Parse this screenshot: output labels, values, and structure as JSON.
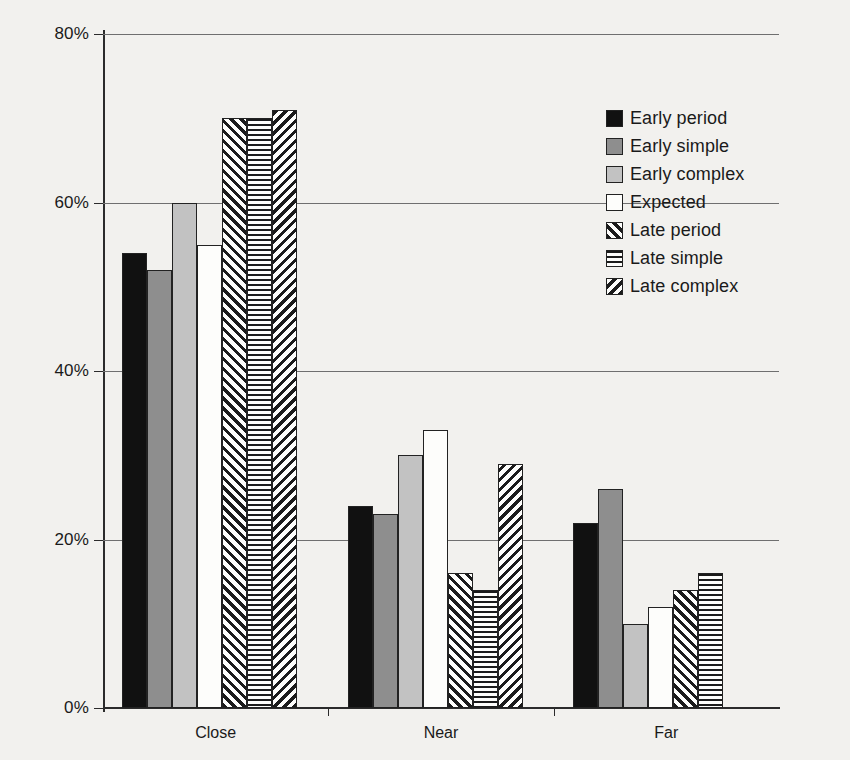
{
  "chart_data": {
    "type": "bar",
    "title": "",
    "subtitle": "",
    "xlabel": "",
    "ylabel": "",
    "categories": [
      "Close",
      "Near",
      "Far"
    ],
    "ylim": [
      0,
      80
    ],
    "ytick_labels": [
      "0%",
      "20%",
      "40%",
      "60%",
      "80%"
    ],
    "ytick_values": [
      0,
      20,
      40,
      60,
      80
    ],
    "grid": "horizontal",
    "legend_position": "inside-top-right",
    "value_suffix": "%",
    "series": [
      {
        "name": "Early period",
        "pattern": "solid-black",
        "color": "#111111",
        "values": [
          54,
          24,
          22
        ]
      },
      {
        "name": "Early simple",
        "pattern": "dark-gray",
        "color": "#8e8e8e",
        "values": [
          52,
          23,
          26
        ]
      },
      {
        "name": "Early complex",
        "pattern": "light-gray",
        "color": "#c2c2c2",
        "values": [
          60,
          30,
          10
        ]
      },
      {
        "name": "Expected",
        "pattern": "white",
        "color": "#fdfdfb",
        "values": [
          55,
          33,
          12
        ]
      },
      {
        "name": "Late period",
        "pattern": "diag-up",
        "color": "#1b1b1b",
        "values": [
          70,
          16,
          14
        ]
      },
      {
        "name": "Late simple",
        "pattern": "horiz",
        "color": "#1b1b1b",
        "values": [
          70,
          14,
          16
        ]
      },
      {
        "name": "Late complex",
        "pattern": "diag-down",
        "color": "#1b1b1b",
        "values": [
          71,
          29,
          0
        ]
      }
    ]
  },
  "legend": {
    "items": [
      {
        "label": "Early period"
      },
      {
        "label": "Early simple"
      },
      {
        "label": "Early complex"
      },
      {
        "label": "Expected"
      },
      {
        "label": "Late period"
      },
      {
        "label": "Late simple"
      },
      {
        "label": "Late complex"
      }
    ]
  },
  "axes": {
    "y_max_label": "80%",
    "y_min_label": "0%"
  }
}
